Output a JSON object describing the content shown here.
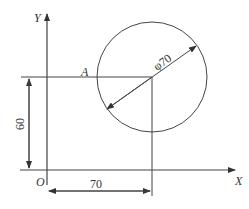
{
  "diagram": {
    "axes": {
      "x_label": "X",
      "y_label": "Y",
      "origin_label": "O"
    },
    "point_label": "A",
    "circle": {
      "diameter_label": "φ70"
    },
    "dimensions": {
      "vertical": "60",
      "horizontal": "70"
    },
    "colors": {
      "line": "#3a3a3a",
      "background": "#ffffff"
    }
  }
}
